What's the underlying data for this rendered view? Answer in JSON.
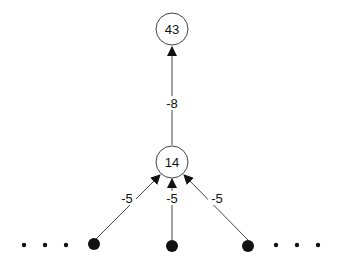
{
  "diagram": {
    "nodes": {
      "top": {
        "label": "43"
      },
      "middle": {
        "label": "14"
      }
    },
    "edges": {
      "middle_to_top": {
        "label": "-8"
      },
      "left_to_middle": {
        "label": "-5"
      },
      "center_to_middle": {
        "label": "-5"
      },
      "right_to_middle": {
        "label": "-5"
      }
    },
    "colors": {
      "stroke": "#444444",
      "fill_dot": "#111111",
      "text": "#111111"
    }
  }
}
